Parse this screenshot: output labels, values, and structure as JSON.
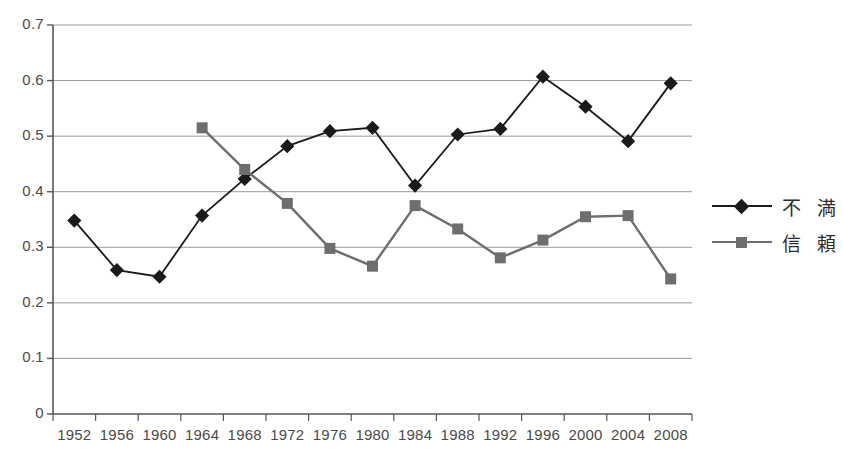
{
  "chart_data": {
    "type": "line",
    "title": "",
    "subtitle": "",
    "xlabel": "",
    "ylabel": "",
    "ylim": [
      0,
      0.7
    ],
    "ytick_values": [
      0,
      0.1,
      0.2,
      0.3,
      0.4,
      0.5,
      0.6,
      0.7
    ],
    "ytick_labels": [
      "0",
      "0.1",
      "0.2",
      "0.3",
      "0.4",
      "0.5",
      "0.6",
      "0.7"
    ],
    "grid": "horizontal",
    "legend_position": "right",
    "categories": [
      1952,
      1956,
      1960,
      1964,
      1968,
      1972,
      1976,
      1980,
      1984,
      1988,
      1992,
      1996,
      2000,
      2004,
      2008
    ],
    "xtick_labels": [
      "1952",
      "1956",
      "1960",
      "1964",
      "1968",
      "1972",
      "1976",
      "1980",
      "1984",
      "1988",
      "1992",
      "1996",
      "2000",
      "2004",
      "2008"
    ],
    "series": [
      {
        "name": "不満",
        "marker": "diamond",
        "color": "#1a1a1a",
        "values": [
          0.348,
          0.259,
          0.247,
          0.357,
          0.423,
          0.482,
          0.509,
          0.515,
          0.411,
          0.503,
          0.513,
          0.607,
          0.553,
          0.491,
          0.595
        ]
      },
      {
        "name": "信頼",
        "marker": "square",
        "color": "#6e6e6e",
        "values": [
          null,
          null,
          null,
          0.515,
          0.44,
          0.379,
          0.298,
          0.266,
          0.375,
          0.333,
          0.281,
          0.313,
          0.355,
          0.357,
          0.243
        ]
      }
    ]
  },
  "legend": {
    "items": [
      {
        "label": "不 満",
        "marker": "diamond",
        "color": "#1a1a1a"
      },
      {
        "label": "信 頼",
        "marker": "square",
        "color": "#6e6e6e"
      }
    ]
  },
  "axes": {
    "gridline_color": "#9a9a9a",
    "axis_color": "#555555"
  }
}
